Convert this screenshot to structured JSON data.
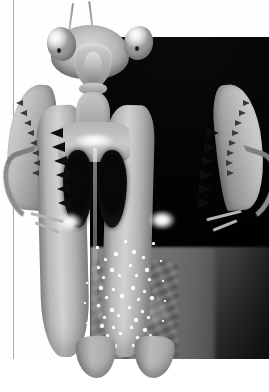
{
  "page": {
    "background_color": "#ffffff",
    "margin_rule_color": "#a9a9a9",
    "width": 269,
    "height": 392
  },
  "figure": {
    "description": "Frontal close-up photograph of a praying mantis in a threat display posture",
    "color_mode": "grayscale",
    "plate": {
      "left": 50,
      "top": 21,
      "width": 191,
      "height": 338,
      "background_color": "#050505"
    },
    "parts": [
      {
        "name": "antenna-left",
        "label": "Left antenna"
      },
      {
        "name": "antenna-right",
        "label": "Right antenna"
      },
      {
        "name": "head",
        "label": "Head"
      },
      {
        "name": "eye-left",
        "label": "Left compound eye"
      },
      {
        "name": "eye-right",
        "label": "Right compound eye"
      },
      {
        "name": "pupil-left",
        "label": "Left pseudopupil"
      },
      {
        "name": "pupil-right",
        "label": "Right pseudopupil"
      },
      {
        "name": "face",
        "label": "Face plate"
      },
      {
        "name": "mandible",
        "label": "Mandibles"
      },
      {
        "name": "prothorax",
        "label": "Prothorax"
      },
      {
        "name": "coxa-block",
        "label": "Coxae"
      },
      {
        "name": "dark-patch-left",
        "label": "Left dark femoral patch"
      },
      {
        "name": "dark-patch-right",
        "label": "Right dark femoral patch"
      },
      {
        "name": "femur-left",
        "label": "Left raptorial femur"
      },
      {
        "name": "femur-right",
        "label": "Right raptorial femur"
      },
      {
        "name": "tibia-left",
        "label": "Left spined tibia"
      },
      {
        "name": "tibia-right",
        "label": "Right spined tibia"
      },
      {
        "name": "claw-left",
        "label": "Left tarsal claw"
      },
      {
        "name": "claw-right",
        "label": "Right tarsal claw"
      }
    ],
    "speckle_dots": [
      [
        104,
        258,
        3
      ],
      [
        114,
        252,
        4
      ],
      [
        97,
        266,
        3
      ],
      [
        110,
        268,
        4
      ],
      [
        102,
        276,
        3
      ],
      [
        118,
        274,
        3
      ],
      [
        99,
        286,
        4
      ],
      [
        112,
        288,
        3
      ],
      [
        105,
        296,
        3
      ],
      [
        120,
        294,
        4
      ],
      [
        97,
        304,
        3
      ],
      [
        110,
        308,
        4
      ],
      [
        103,
        316,
        3
      ],
      [
        117,
        314,
        3
      ],
      [
        100,
        324,
        4
      ],
      [
        112,
        326,
        3
      ],
      [
        106,
        334,
        3
      ],
      [
        119,
        332,
        3
      ],
      [
        101,
        342,
        3
      ],
      [
        113,
        344,
        4
      ],
      [
        132,
        250,
        4
      ],
      [
        142,
        256,
        3
      ],
      [
        129,
        264,
        3
      ],
      [
        145,
        268,
        4
      ],
      [
        135,
        274,
        3
      ],
      [
        148,
        278,
        3
      ],
      [
        131,
        286,
        4
      ],
      [
        143,
        290,
        3
      ],
      [
        137,
        298,
        3
      ],
      [
        150,
        296,
        4
      ],
      [
        128,
        306,
        3
      ],
      [
        141,
        310,
        3
      ],
      [
        134,
        318,
        4
      ],
      [
        147,
        316,
        3
      ],
      [
        130,
        326,
        3
      ],
      [
        143,
        328,
        4
      ],
      [
        136,
        336,
        3
      ],
      [
        149,
        334,
        3
      ],
      [
        132,
        344,
        3
      ],
      [
        144,
        346,
        3
      ],
      [
        88,
        262,
        2
      ],
      [
        86,
        282,
        2
      ],
      [
        84,
        302,
        2
      ],
      [
        86,
        322,
        2
      ],
      [
        88,
        340,
        2
      ],
      [
        160,
        260,
        2
      ],
      [
        162,
        280,
        2
      ],
      [
        164,
        300,
        2
      ],
      [
        162,
        320,
        2
      ],
      [
        160,
        338,
        2
      ],
      [
        124,
        240,
        3
      ],
      [
        152,
        242,
        3
      ],
      [
        96,
        246,
        3
      ]
    ],
    "spine_rows": {
      "left_tibia": [
        [
          16,
          100
        ],
        [
          20,
          110
        ],
        [
          24,
          120
        ],
        [
          27,
          130
        ],
        [
          30,
          140
        ],
        [
          32,
          150
        ],
        [
          33,
          160
        ],
        [
          32,
          170
        ]
      ],
      "right_tibia": [
        [
          243,
          100
        ],
        [
          239,
          110
        ],
        [
          235,
          120
        ],
        [
          232,
          130
        ],
        [
          229,
          140
        ],
        [
          227,
          150
        ],
        [
          226,
          160
        ],
        [
          227,
          170
        ]
      ],
      "left_femur_inner": [
        [
          50,
          128
        ],
        [
          52,
          142
        ],
        [
          54,
          156
        ],
        [
          56,
          170
        ],
        [
          57,
          184
        ],
        [
          58,
          198
        ]
      ],
      "right_femur_inner": [
        [
          206,
          128
        ],
        [
          204,
          142
        ],
        [
          202,
          156
        ],
        [
          200,
          170
        ],
        [
          199,
          184
        ],
        [
          198,
          198
        ]
      ]
    }
  }
}
